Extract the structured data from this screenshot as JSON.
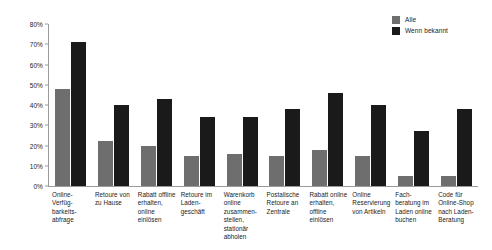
{
  "chart_data": {
    "type": "bar",
    "title": "",
    "subtitle": "",
    "xlabel": "",
    "ylabel": "",
    "ylim": [
      0,
      80
    ],
    "grid": false,
    "legend_position": "top-right",
    "ytick_labels": [
      "80%",
      "70%",
      "60%",
      "50%",
      "40%",
      "30%",
      "20%",
      "10%",
      "0%"
    ],
    "ytick_values": [
      80,
      70,
      60,
      50,
      40,
      30,
      20,
      10,
      0
    ],
    "categories": [
      "Online-Verfüg-barkeits-abfrage",
      "Retoure von zu Hause",
      "Rabatt offline erhalten, online einlösen",
      "Retoure im Laden-geschäft",
      "Warenkorb online zusammen-stellen, stationär abholen",
      "Postalische Retoure an Zentrale",
      "Rabatt online erhalten, offline einlösen",
      "Online Reservierung von Artikeln",
      "Fach-beratung im Laden online buchen",
      "Code für Online-Shop nach Laden-Beratung"
    ],
    "series": [
      {
        "name": "Alle",
        "color": "#6e6e6e",
        "values": [
          48,
          22,
          20,
          15,
          16,
          15,
          18,
          15,
          5,
          5
        ]
      },
      {
        "name": "Wenn bekannt",
        "color": "#1a1a1a",
        "values": [
          71,
          40,
          43,
          34,
          34,
          38,
          46,
          40,
          27,
          38
        ]
      }
    ]
  }
}
